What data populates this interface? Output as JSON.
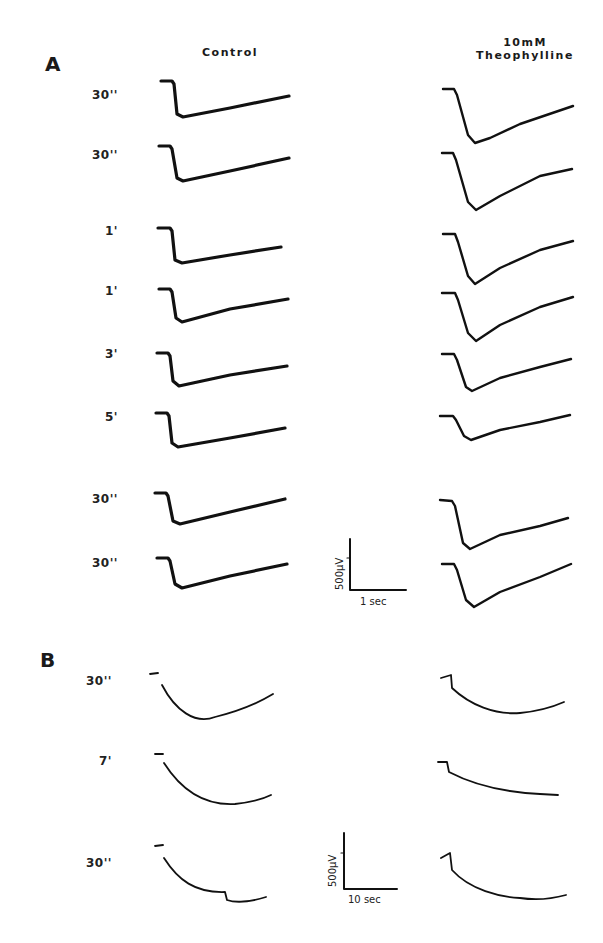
{
  "figure": {
    "panels": [
      {
        "id": "A",
        "label": "A",
        "columns": [
          "Control",
          "10 mM Theophylline"
        ],
        "column_header_lines": {
          "control": "Control",
          "theophylline_line1": "10mM",
          "theophylline_line2": "Theophylline"
        },
        "row_labels": [
          "30''",
          "30''",
          "1'",
          "1'",
          "3'",
          "5'",
          "30''",
          "30''"
        ],
        "scale_bar": {
          "vertical": "500µV",
          "horizontal": "1 sec"
        }
      },
      {
        "id": "B",
        "label": "B",
        "row_labels": [
          "30''",
          "7'",
          "30''"
        ],
        "scale_bar": {
          "vertical": "500µV",
          "horizontal": "10 sec"
        }
      }
    ],
    "colors": {
      "trace": "#111111",
      "background": "#ffffff",
      "text": "#1a1a1a"
    }
  }
}
